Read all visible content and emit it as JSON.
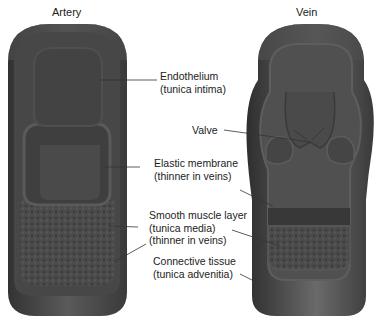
{
  "figure": {
    "titles": {
      "artery": "Artery",
      "vein": "Vein"
    },
    "labels": {
      "endothelium": {
        "line1": "Endothelium",
        "line2": "(tunica intima)"
      },
      "valve": {
        "line1": "Valve"
      },
      "elastic": {
        "line1": "Elastic membrane",
        "line2": "(thinner in veins)"
      },
      "smooth": {
        "line1": "Smooth muscle layer",
        "line2": "(tunica media)",
        "line3": "(thinner in veins)"
      },
      "connective": {
        "line1": "Connective tissue",
        "line2": "(tunica advenitia)"
      }
    },
    "colors": {
      "outer": "#4a4a4a",
      "middle": "#555555",
      "inner": "#3e3e3e",
      "leader": "#333333",
      "text": "#222222"
    }
  }
}
